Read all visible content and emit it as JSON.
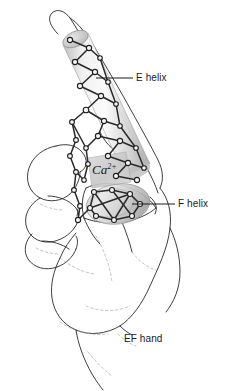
{
  "figure": {
    "title": "EF hand",
    "background_color": "#ffffff",
    "ink_color": "#1b1b1b",
    "helix_fill_color": "#c9c9c9",
    "ion_patch_color": "#cfcfcf",
    "labels": [
      {
        "id": "e-helix",
        "text": "E helix",
        "leader": "horizontal line from index finger to label",
        "x": 136,
        "y": 72
      },
      {
        "id": "f-helix",
        "text": "F helix",
        "leader": "horizontal line from thumb to label",
        "x": 178,
        "y": 198
      },
      {
        "id": "ef-hand",
        "text": "EF hand",
        "leader": "none",
        "x": 124,
        "y": 333
      }
    ],
    "ion_label": {
      "id": "calcium-ion",
      "base": "Ca",
      "superscript": "2+",
      "full_text": "Ca2+",
      "style": "italic serif"
    },
    "structures": [
      {
        "id": "e-helix-cylinder",
        "name": "E helix",
        "maps_to": "index finger"
      },
      {
        "id": "f-helix-cylinder",
        "name": "F helix",
        "maps_to": "thumb"
      },
      {
        "id": "binding-loop",
        "name": "Ca2+ binding loop",
        "maps_to": "curled middle finger"
      }
    ]
  }
}
